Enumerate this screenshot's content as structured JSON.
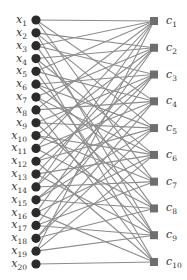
{
  "diagram": {
    "type": "bipartite-graph",
    "left_nodes": {
      "shape": "circle",
      "color": "#2b2b2b",
      "labels": [
        "x1",
        "x2",
        "x3",
        "x4",
        "x5",
        "x6",
        "x7",
        "x8",
        "x9",
        "x10",
        "x11",
        "x12",
        "x13",
        "x14",
        "x15",
        "x16",
        "x17",
        "x18",
        "x19",
        "x20"
      ]
    },
    "right_nodes": {
      "shape": "square",
      "color": "#6e6e6e",
      "labels": [
        "c1",
        "c2",
        "c3",
        "c4",
        "c5",
        "c6",
        "c7",
        "c8",
        "c9",
        "c10"
      ]
    },
    "edge_color": "#8c8c8c",
    "edges": [
      [
        1,
        1
      ],
      [
        1,
        4
      ],
      [
        1,
        7
      ],
      [
        2,
        2
      ],
      [
        2,
        5
      ],
      [
        2,
        9
      ],
      [
        3,
        1
      ],
      [
        3,
        3
      ],
      [
        3,
        8
      ],
      [
        4,
        2
      ],
      [
        4,
        6
      ],
      [
        4,
        10
      ],
      [
        5,
        1
      ],
      [
        5,
        4
      ],
      [
        5,
        9
      ],
      [
        6,
        3
      ],
      [
        6,
        5
      ],
      [
        6,
        7
      ],
      [
        7,
        2
      ],
      [
        7,
        6
      ],
      [
        7,
        8
      ],
      [
        8,
        1
      ],
      [
        8,
        4
      ],
      [
        8,
        10
      ],
      [
        9,
        3
      ],
      [
        9,
        5
      ],
      [
        9,
        9
      ],
      [
        10,
        2
      ],
      [
        10,
        6
      ],
      [
        10,
        7
      ],
      [
        11,
        1
      ],
      [
        11,
        4
      ],
      [
        11,
        8
      ],
      [
        12,
        3
      ],
      [
        12,
        5
      ],
      [
        12,
        10
      ],
      [
        13,
        2
      ],
      [
        13,
        6
      ],
      [
        13,
        9
      ],
      [
        14,
        1
      ],
      [
        14,
        3
      ],
      [
        14,
        7
      ],
      [
        15,
        4
      ],
      [
        15,
        5
      ],
      [
        15,
        8
      ],
      [
        16,
        2
      ],
      [
        16,
        6
      ],
      [
        16,
        10
      ],
      [
        17,
        3
      ],
      [
        17,
        7
      ],
      [
        17,
        9
      ],
      [
        18,
        4
      ],
      [
        18,
        5
      ],
      [
        18,
        8
      ],
      [
        19,
        1
      ],
      [
        19,
        6
      ],
      [
        19,
        9
      ],
      [
        20,
        10
      ]
    ]
  }
}
